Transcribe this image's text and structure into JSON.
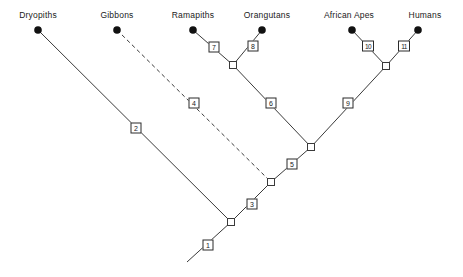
{
  "diagram": {
    "type": "cladogram",
    "title": "",
    "taxa": [
      {
        "id": "dryopiths",
        "label": "Dryopiths",
        "label_x": 38,
        "label_y": 10,
        "tip_x": 38,
        "tip_y": 30
      },
      {
        "id": "gibbons",
        "label": "Gibbons",
        "label_x": 117,
        "label_y": 10,
        "tip_x": 117,
        "tip_y": 30
      },
      {
        "id": "ramapiths",
        "label": "Ramapiths",
        "label_x": 193,
        "label_y": 10,
        "tip_x": 193,
        "tip_y": 30
      },
      {
        "id": "orangutans",
        "label": "Orangutans",
        "label_x": 267,
        "label_y": 10,
        "tip_x": 262,
        "tip_y": 30
      },
      {
        "id": "africanapes",
        "label": "African Apes",
        "label_x": 349,
        "label_y": 10,
        "tip_x": 352,
        "tip_y": 30
      },
      {
        "id": "humans",
        "label": "Humans",
        "label_x": 425,
        "label_y": 10,
        "tip_x": 418,
        "tip_y": 30
      }
    ],
    "nodes": [
      {
        "id": "n-orang-rama",
        "x": 233,
        "y": 65
      },
      {
        "id": "n-afr-hum",
        "x": 386,
        "y": 66
      },
      {
        "id": "n-great-ape",
        "x": 311,
        "y": 147
      },
      {
        "id": "n-gibbon",
        "x": 271,
        "y": 182
      },
      {
        "id": "n-root",
        "x": 231,
        "y": 222
      }
    ],
    "branch_labels": [
      {
        "n": "1",
        "x": 208,
        "y": 245
      },
      {
        "n": "2",
        "x": 136,
        "y": 128
      },
      {
        "n": "3",
        "x": 252,
        "y": 204
      },
      {
        "n": "4",
        "x": 194,
        "y": 103
      },
      {
        "n": "5",
        "x": 292,
        "y": 164
      },
      {
        "n": "6",
        "x": 271,
        "y": 103
      },
      {
        "n": "7",
        "x": 214,
        "y": 47
      },
      {
        "n": "8",
        "x": 253,
        "y": 46
      },
      {
        "n": "9",
        "x": 348,
        "y": 103
      },
      {
        "n": "10",
        "x": 368,
        "y": 46
      },
      {
        "n": "11",
        "x": 404,
        "y": 46
      }
    ],
    "edges": [
      {
        "id": "edge-dryopiths-root",
        "from": "dryopiths",
        "to": "n-root",
        "style": "solid"
      },
      {
        "id": "edge-gibbons-node",
        "from": "gibbons",
        "to": "n-gibbon",
        "style": "dashed"
      },
      {
        "id": "edge-ramapiths-node",
        "from": "ramapiths",
        "to": "n-orang-rama",
        "style": "solid"
      },
      {
        "id": "edge-orangutans-node",
        "from": "orangutans",
        "to": "n-orang-rama",
        "style": "solid"
      },
      {
        "id": "edge-africanapes-node",
        "from": "africanapes",
        "to": "n-afr-hum",
        "style": "solid"
      },
      {
        "id": "edge-humans-node",
        "from": "humans",
        "to": "n-afr-hum",
        "style": "solid"
      },
      {
        "id": "edge-orangclade-great",
        "from": "n-orang-rama",
        "to": "n-great-ape",
        "style": "solid"
      },
      {
        "id": "edge-afrhum-great",
        "from": "n-afr-hum",
        "to": "n-great-ape",
        "style": "solid"
      },
      {
        "id": "edge-great-gibbon",
        "from": "n-great-ape",
        "to": "n-gibbon",
        "style": "solid"
      },
      {
        "id": "edge-gibbon-root",
        "from": "n-gibbon",
        "to": "n-root",
        "style": "solid"
      },
      {
        "id": "edge-root-stem",
        "from": "n-root",
        "to": "stem",
        "style": "solid"
      }
    ],
    "stem": {
      "x": 187,
      "y": 262
    },
    "colors": {
      "line": "#3a3a3a",
      "tip": "#111111",
      "box_border": "#2b2b2b",
      "box_fill": "#ffffff",
      "text": "#1a1a1a",
      "background": "#ffffff"
    }
  }
}
